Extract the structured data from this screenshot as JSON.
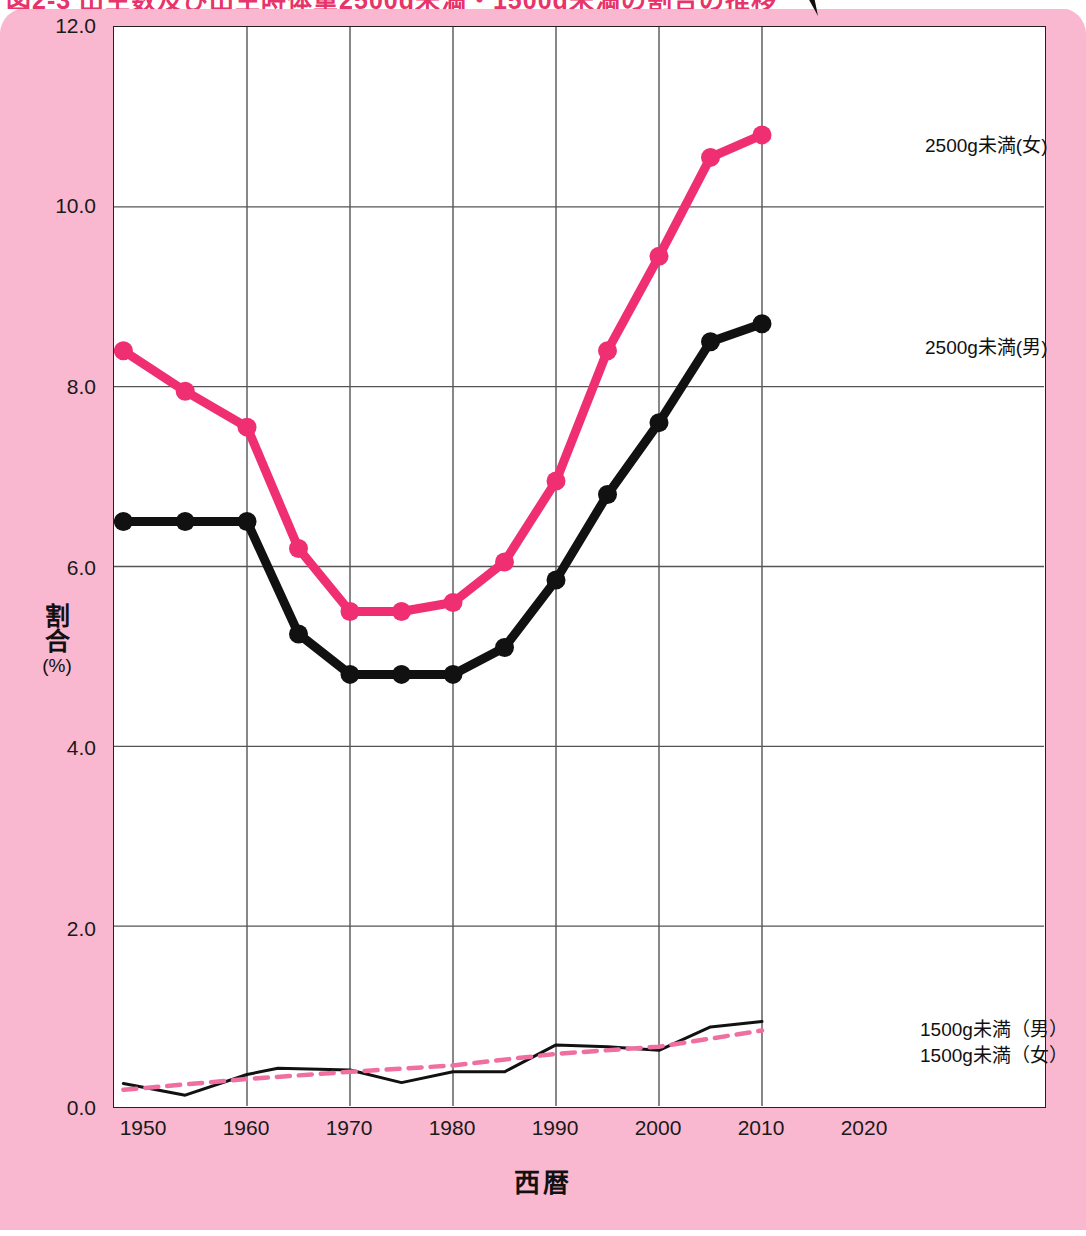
{
  "title": "図2-3 出生数及び出生時体重2500g未満・1500g未満の割合の推移",
  "axes": {
    "y_label": "割合",
    "y_unit": "(%)",
    "x_label": "西暦",
    "yticks": [
      "0.0",
      "2.0",
      "4.0",
      "6.0",
      "8.0",
      "10.0",
      "12.0"
    ],
    "xticks": [
      "1950",
      "1960",
      "1970",
      "1980",
      "1990",
      "2000",
      "2010",
      "2020"
    ]
  },
  "legend": {
    "f2500": "2500g未満(女)",
    "m2500": "2500g未満(男)",
    "m1500": "1500g未満（男）",
    "f1500": "1500g未満（女）"
  },
  "colors": {
    "background_pink": "#f9b8cf",
    "female_line": "#ef2f72",
    "male_line": "#111111",
    "plot_bg": "#ffffff",
    "grid": "#555555",
    "title_text": "#e8336b"
  },
  "chart_data": {
    "type": "line",
    "title": "出生時体重2500g未満・1500g未満の割合の推移",
    "xlabel": "西暦",
    "ylabel": "割合(%)",
    "xlim": [
      1948,
      2020
    ],
    "ylim": [
      0.0,
      12.0
    ],
    "grid": true,
    "legend_position": "right-inline",
    "series": [
      {
        "name": "2500g未満(女)",
        "color": "#ef2f72",
        "style": "solid-thick-markers",
        "x": [
          1948,
          1954,
          1960,
          1965,
          1970,
          1975,
          1980,
          1985,
          1990,
          1995,
          2000,
          2005,
          2010
        ],
        "values": [
          8.4,
          7.95,
          7.55,
          6.2,
          5.5,
          5.5,
          5.6,
          6.05,
          6.95,
          8.4,
          9.45,
          10.55,
          10.8
        ]
      },
      {
        "name": "2500g未満(男)",
        "color": "#111111",
        "style": "solid-thick-markers",
        "x": [
          1948,
          1954,
          1960,
          1965,
          1970,
          1975,
          1980,
          1985,
          1990,
          1995,
          2000,
          2005,
          2010
        ],
        "values": [
          6.5,
          6.5,
          6.5,
          5.25,
          4.8,
          4.8,
          4.8,
          5.1,
          5.85,
          6.8,
          7.6,
          8.5,
          8.7
        ]
      },
      {
        "name": "1500g未満（男）",
        "color": "#111111",
        "style": "solid-thin",
        "x": [
          1948,
          1954,
          1960,
          1963,
          1970,
          1975,
          1980,
          1985,
          1990,
          1995,
          2000,
          2005,
          2010
        ],
        "values": [
          0.25,
          0.12,
          0.35,
          0.42,
          0.4,
          0.26,
          0.38,
          0.38,
          0.68,
          0.66,
          0.62,
          0.88,
          0.94
        ]
      },
      {
        "name": "1500g未満（女）",
        "color": "#ef6fa0",
        "style": "dashed",
        "x": [
          1948,
          1960,
          1970,
          1980,
          1990,
          2000,
          2010
        ],
        "values": [
          0.18,
          0.3,
          0.38,
          0.45,
          0.58,
          0.66,
          0.84
        ]
      }
    ]
  }
}
